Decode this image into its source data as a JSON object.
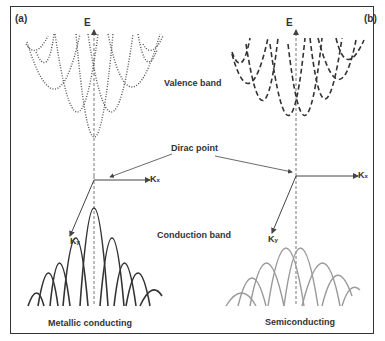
{
  "panels": {
    "a": {
      "tag": "(a)",
      "caption": "Metallic conducting"
    },
    "b": {
      "tag": "(b)",
      "caption": "Semiconducting"
    }
  },
  "labels": {
    "energy": "E",
    "kx": "K",
    "kx_sub": "x",
    "ky": "K",
    "ky_sub": "y",
    "valence_band": "Valence band",
    "dirac_point": "Dirac point",
    "conduction_band": "Conduction band"
  },
  "colors": {
    "valence_a": "#555555",
    "valence_b": "#333333",
    "conduction_a": "#333333",
    "conduction_b": "#999999",
    "frame": "#333333"
  }
}
